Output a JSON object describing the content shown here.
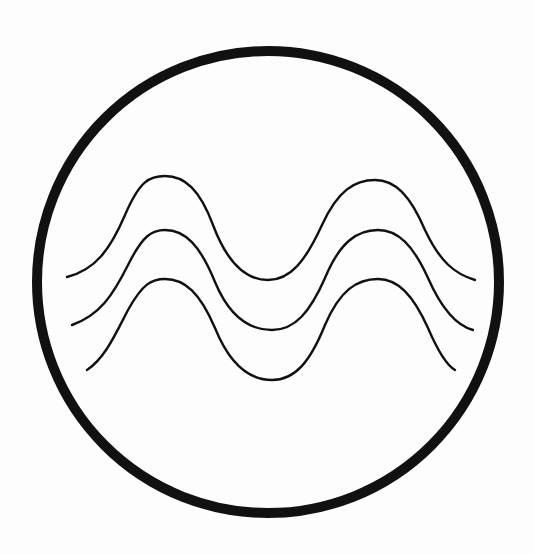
{
  "figure": {
    "title": "Aquarius / water waves symbol",
    "background": "#fdfdfd",
    "stroke_color": "#111111",
    "circle": {
      "cx": 268,
      "cy": 282,
      "r": 231,
      "stroke_width": 10
    },
    "waves": [
      {
        "name": "wave-top",
        "stroke_width": 2.4,
        "path": "M67,277 C95,270 110,250 125,215 C140,180 150,176 165,176 C185,176 200,190 213,225 C228,265 248,280 268,280 C290,280 305,262 322,225 C338,190 355,180 375,180 C395,180 410,195 425,230 C440,262 455,274 475,280"
      },
      {
        "name": "wave-middle",
        "stroke_width": 2.4,
        "path": "M72,325 C100,315 113,295 128,265 C143,235 152,230 165,230 C185,230 200,245 215,282 C230,318 250,330 272,330 C295,330 310,312 325,278 C340,242 357,230 378,230 C398,230 413,245 428,278 C443,312 458,326 473,330"
      },
      {
        "name": "wave-bottom",
        "stroke_width": 2.4,
        "path": "M87,370 C105,358 115,335 128,310 C143,283 152,279 165,279 C185,279 200,293 215,328 C230,365 250,380 272,380 C295,380 310,362 325,325 C340,290 357,279 378,279 C398,279 413,295 428,328 C440,356 448,366 455,370"
      }
    ]
  }
}
